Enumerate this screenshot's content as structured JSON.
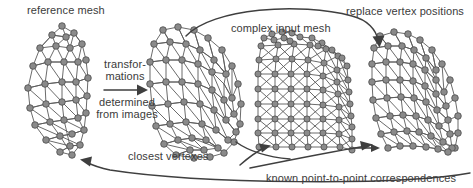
{
  "figure": {
    "title_alt": "mesh registration pipeline diagram",
    "background": "#ffffff",
    "node_color": "#8a8a8a",
    "edge_color": "#5a5a5a",
    "arrow_color": "#3f3f3f",
    "text_color": "#3b3b3b"
  },
  "labels": {
    "reference_mesh": "reference mesh",
    "transformations_line1": "transfor-",
    "transformations_line2": "mations",
    "determined_line1": "determined",
    "determined_line2": "from images",
    "complex_input_mesh": "complex input mesh",
    "replace_vertex_positions": "replace vertex positions",
    "closest_vertexes": "closest vertexes",
    "known_correspondences": "known point-to-point correspondences"
  },
  "meshes": [
    {
      "name": "reference-mesh",
      "description": "tall narrow triangulated reference mesh",
      "x": 18,
      "y": 22,
      "w": 80,
      "h": 135
    },
    {
      "name": "transformed-mesh",
      "description": "transformed coarse triangulated mesh",
      "x": 148,
      "y": 22,
      "w": 95,
      "h": 135
    },
    {
      "name": "complex-input-mesh",
      "description": "dense complex input mesh with many vertices",
      "x": 255,
      "y": 28,
      "w": 100,
      "h": 130
    },
    {
      "name": "result-mesh",
      "description": "coarse mesh with replaced vertex positions",
      "x": 368,
      "y": 28,
      "w": 95,
      "h": 130
    }
  ],
  "arrows": [
    {
      "name": "transformation-arrow",
      "direction": "right",
      "label": "transformations determined from images"
    },
    {
      "name": "complex-input-arrow",
      "direction": "arc-right-down",
      "label": "complex input mesh"
    },
    {
      "name": "closest-vertexes-arrow",
      "direction": "arc-left",
      "label": "closest vertexes"
    },
    {
      "name": "correspondences-arrow",
      "direction": "arc-right-up",
      "label": "known point-to-point correspondences"
    },
    {
      "name": "return-arrow",
      "direction": "left",
      "label": ""
    }
  ]
}
